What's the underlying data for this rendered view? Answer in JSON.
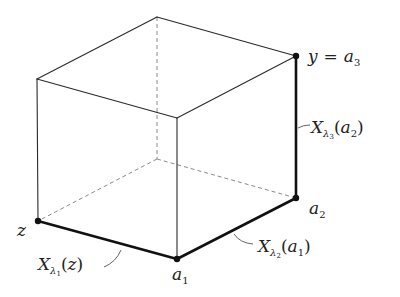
{
  "figure": {
    "vertices": {
      "top_back": {
        "x": 157,
        "y": 17
      },
      "top_left": {
        "x": 37,
        "y": 79
      },
      "top_front": {
        "x": 177,
        "y": 118
      },
      "top_right_y": {
        "x": 296,
        "y": 56
      },
      "bottom_back": {
        "x": 157,
        "y": 159
      },
      "bottom_left_z": {
        "x": 38,
        "y": 221
      },
      "bottom_front_a1": {
        "x": 177,
        "y": 259
      },
      "bottom_right_a2": {
        "x": 296,
        "y": 198
      }
    },
    "labels": {
      "y_eq": {
        "y": "y",
        "eq": "=",
        "a": "a",
        "sub": "3"
      },
      "a2": {
        "a": "a",
        "sub": "2"
      },
      "a1": {
        "a": "a",
        "sub": "1"
      },
      "z": "z",
      "x_l1": {
        "X": "X",
        "lambda": "λ",
        "lsub": "1",
        "open": "(",
        "arg": "z",
        "close": ")"
      },
      "x_l2": {
        "X": "X",
        "lambda": "λ",
        "lsub": "2",
        "open": "(",
        "arg": "a",
        "argsub": "1",
        "close": ")"
      },
      "x_l3": {
        "X": "X",
        "lambda": "λ",
        "lsub": "3",
        "open": "(",
        "arg": "a",
        "argsub": "2",
        "close": ")"
      }
    },
    "colors": {
      "edge": "#2a2a2a",
      "hidden_edge": "#8a8a8a",
      "bold_edge": "#111111",
      "background": "#ffffff"
    }
  }
}
